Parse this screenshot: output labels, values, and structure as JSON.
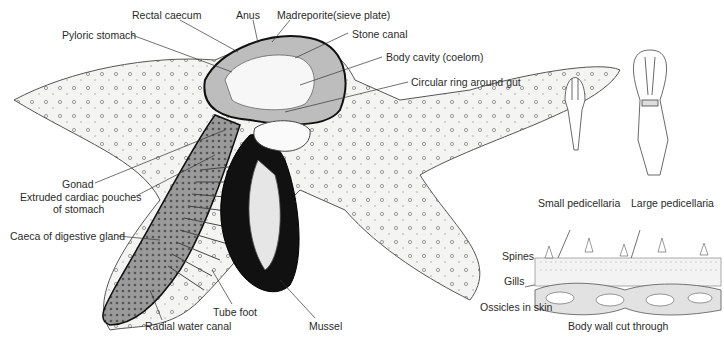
{
  "figure": {
    "main_labels": {
      "rectal_caecum": "Rectal caecum",
      "anus": "Anus",
      "madreporite": "Madreporite(sieve plate)",
      "pyloric_stomach": "Pyloric stomach",
      "stone_canal": "Stone canal",
      "body_cavity": "Body cavity (coelom)",
      "circular_ring": "Circular ring around gut",
      "gonad": "Gonad",
      "cardiac_pouches_1": "Extruded cardiac pouches",
      "cardiac_pouches_2": "of stomach",
      "caeca": "Caeca of digestive gland",
      "tube_foot": "Tube foot",
      "radial_canal": "Radial water canal",
      "mussel": "Mussel"
    },
    "detail_labels": {
      "small_pedicellaria": "Small pedicellaria",
      "large_pedicellaria": "Large pedicellaria",
      "spines": "Spines",
      "gills": "Gills",
      "ossicles": "Ossicles in skin",
      "body_wall": "Body wall cut through"
    }
  }
}
